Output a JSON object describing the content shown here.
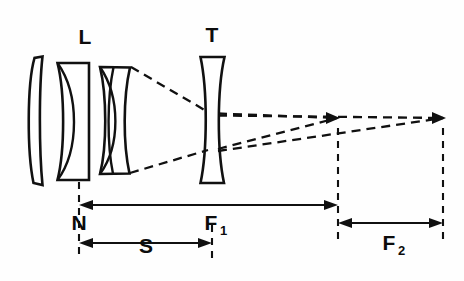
{
  "figure": {
    "type": "optical-ray-diagram",
    "background_color": "#fefefe",
    "ink_color": "#101010"
  },
  "labels": {
    "objective_group": "L",
    "negative_group": "T",
    "nodal_point": "N",
    "front_focal": "F",
    "front_focal_sub": "1",
    "back_focal": "F",
    "back_focal_sub": "2",
    "separation": "S"
  },
  "elements": [
    {
      "name": "objective-lens-element-1",
      "kind": "meniscus-positive",
      "group": "L"
    },
    {
      "name": "objective-lens-element-2",
      "kind": "cemented-doublet",
      "group": "L"
    },
    {
      "name": "objective-lens-element-3",
      "kind": "cemented-doublet",
      "group": "L"
    },
    {
      "name": "tele-negative-element",
      "kind": "biconcave-negative",
      "group": "T"
    }
  ],
  "dimensions": [
    {
      "name": "F1",
      "label": "F",
      "subscript": "1",
      "from": "N",
      "to": "primary-focus"
    },
    {
      "name": "F2",
      "label": "F",
      "subscript": "2",
      "from": "primary-focus",
      "to": "image-plane"
    },
    {
      "name": "S",
      "label": "S",
      "subscript": "",
      "from": "N",
      "to": "tele-element"
    }
  ],
  "rays": {
    "count": 2,
    "description": "converging marginal rays from objective, diverged by negative element to distant focus"
  }
}
